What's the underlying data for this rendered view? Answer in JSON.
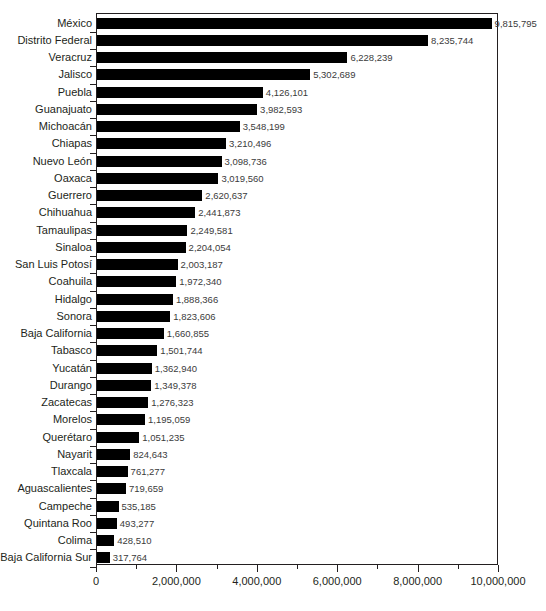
{
  "chart_data": {
    "type": "bar",
    "orientation": "horizontal",
    "title": "",
    "subtitle": "",
    "xlabel": "",
    "ylabel": "",
    "xlim": [
      0,
      10000000
    ],
    "grid": false,
    "legend": null,
    "x_major_step": 2000000,
    "x_minor_step": 1000000,
    "xtick_labels": [
      "0",
      "2,000,000",
      "4,000,000",
      "6,000,000",
      "8,000,000",
      "10,000,000"
    ],
    "xtick_values": [
      0,
      2000000,
      4000000,
      6000000,
      8000000,
      10000000
    ],
    "bar_color": "#000000",
    "axis_color": "#231f20",
    "categories": [
      "México",
      "Distrito Federal",
      "Veracruz",
      "Jalisco",
      "Puebla",
      "Guanajuato",
      "Michoacán",
      "Chiapas",
      "Nuevo León",
      "Oaxaca",
      "Guerrero",
      "Chihuahua",
      "Tamaulipas",
      "Sinaloa",
      "San Luis Potosí",
      "Coahuila",
      "Hidalgo",
      "Sonora",
      "Baja California",
      "Tabasco",
      "Yucatán",
      "Durango",
      "Zacatecas",
      "Morelos",
      "Querétaro",
      "Nayarit",
      "Tlaxcala",
      "Aguascalientes",
      "Campeche",
      "Quintana Roo",
      "Colima",
      "Baja California Sur"
    ],
    "values": [
      9815795,
      8235744,
      6228239,
      5302689,
      4126101,
      3982593,
      3548199,
      3210496,
      3098736,
      3019560,
      2620637,
      2441873,
      2249581,
      2204054,
      2003187,
      1972340,
      1888366,
      1823606,
      1660855,
      1501744,
      1362940,
      1349378,
      1276323,
      1195059,
      1051235,
      824643,
      761277,
      719659,
      535185,
      493277,
      428510,
      317764
    ],
    "value_labels": [
      "9,815,795",
      "8,235,744",
      "6,228,239",
      "5,302,689",
      "4,126,101",
      "3,982,593",
      "3,548,199",
      "3,210,496",
      "3,098,736",
      "3,019,560",
      "2,620,637",
      "2,441,873",
      "2,249,581",
      "2,204,054",
      "2,003,187",
      "1,972,340",
      "1,888,366",
      "1,823,606",
      "1,660,855",
      "1,501,744",
      "1,362,940",
      "1,349,378",
      "1,276,323",
      "1,195,059",
      "1,051,235",
      "824,643",
      "761,277",
      "719,659",
      "535,185",
      "493,277",
      "428,510",
      "317,764"
    ]
  }
}
